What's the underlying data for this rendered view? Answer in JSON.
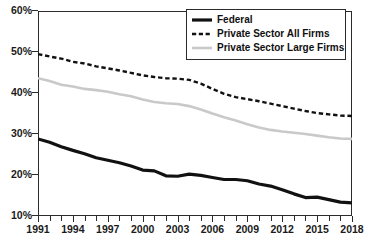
{
  "chart_data": {
    "type": "line",
    "title": "",
    "xlabel": "",
    "ylabel": "",
    "ylim": [
      10,
      60
    ],
    "xlim": [
      1991,
      2018
    ],
    "ytick_labels": [
      "10%",
      "20%",
      "30%",
      "40%",
      "50%",
      "60%"
    ],
    "ytick_values": [
      10,
      20,
      30,
      40,
      50,
      60
    ],
    "xtick_labels": [
      "1991",
      "1994",
      "1997",
      "2000",
      "2003",
      "2006",
      "2009",
      "2012",
      "2015",
      "2018"
    ],
    "xtick_values": [
      1991,
      1994,
      1997,
      2000,
      2003,
      2006,
      2009,
      2012,
      2015,
      2018
    ],
    "grid": false,
    "legend_position": "top-right",
    "x": [
      1991,
      1992,
      1993,
      1994,
      1995,
      1996,
      1997,
      1998,
      1999,
      2000,
      2001,
      2002,
      2003,
      2004,
      2005,
      2006,
      2007,
      2008,
      2009,
      2010,
      2011,
      2012,
      2013,
      2014,
      2015,
      2016,
      2017,
      2018
    ],
    "series": [
      {
        "name": "Federal",
        "style": "solid",
        "color": "#111111",
        "width": 3.2,
        "values": [
          28.8,
          28.0,
          26.9,
          26.0,
          25.2,
          24.2,
          23.6,
          23.0,
          22.2,
          21.2,
          21.0,
          19.8,
          19.7,
          20.2,
          19.9,
          19.4,
          18.9,
          18.9,
          18.6,
          17.8,
          17.3,
          16.4,
          15.4,
          14.5,
          14.6,
          14.0,
          13.4,
          13.2
        ]
      },
      {
        "name": "Private Sector All Firms",
        "style": "dashed",
        "color": "#111111",
        "width": 2.4,
        "values": [
          49.5,
          48.9,
          48.4,
          47.6,
          47.2,
          46.5,
          46.0,
          45.5,
          44.9,
          44.3,
          43.9,
          43.6,
          43.5,
          43.2,
          42.3,
          41.0,
          39.8,
          39.0,
          38.5,
          38.0,
          37.4,
          36.8,
          36.2,
          35.6,
          35.1,
          34.8,
          34.5,
          34.4
        ]
      },
      {
        "name": "Private Sector Large Firms",
        "style": "solid",
        "color": "#c9c9c9",
        "width": 2.6,
        "values": [
          43.6,
          42.9,
          42.0,
          41.6,
          41.0,
          40.7,
          40.3,
          39.7,
          39.2,
          38.4,
          37.8,
          37.5,
          37.3,
          36.8,
          36.0,
          35.0,
          34.1,
          33.3,
          32.4,
          31.6,
          31.0,
          30.6,
          30.3,
          30.0,
          29.6,
          29.2,
          28.9,
          28.8
        ]
      }
    ]
  },
  "legend": {
    "items": [
      {
        "label": "Federal"
      },
      {
        "label": "Private Sector All Firms"
      },
      {
        "label": "Private Sector Large Firms"
      }
    ]
  }
}
